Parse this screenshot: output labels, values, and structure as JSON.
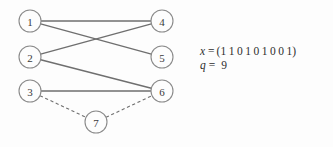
{
  "figure": {
    "name": "bipartite-matching-graph",
    "background_color": "#fdfdfd",
    "edge_color": "#6f6f6f",
    "node_stroke_color": "#8a8a8a",
    "node_label_color": "#3a3a3a"
  },
  "graph": {
    "nodes": [
      {
        "id": "1",
        "label": "1",
        "cx": 30,
        "cy": 21,
        "r": 11
      },
      {
        "id": "2",
        "label": "2",
        "cx": 30,
        "cy": 57,
        "r": 11
      },
      {
        "id": "3",
        "label": "3",
        "cx": 30,
        "cy": 91,
        "r": 11
      },
      {
        "id": "4",
        "label": "4",
        "cx": 162,
        "cy": 21,
        "r": 11
      },
      {
        "id": "5",
        "label": "5",
        "cx": 162,
        "cy": 57,
        "r": 11
      },
      {
        "id": "6",
        "label": "6",
        "cx": 162,
        "cy": 91,
        "r": 11
      },
      {
        "id": "7",
        "label": "7",
        "cx": 96,
        "cy": 122,
        "r": 11
      }
    ],
    "edges": [
      {
        "from": "1",
        "to": "4",
        "style": "solid"
      },
      {
        "from": "1",
        "to": "5",
        "style": "solid"
      },
      {
        "from": "2",
        "to": "4",
        "style": "solid"
      },
      {
        "from": "2",
        "to": "6",
        "style": "solid"
      },
      {
        "from": "3",
        "to": "6",
        "style": "solid"
      },
      {
        "from": "3",
        "to": "7",
        "style": "dashed"
      },
      {
        "from": "7",
        "to": "6",
        "style": "dashed"
      }
    ]
  },
  "annotation": {
    "x_line": {
      "variable": "x",
      "operator": "=",
      "open_paren": "(",
      "bits": [
        "1",
        "1",
        "0",
        "1",
        "0",
        "1",
        "0",
        "0",
        "1"
      ],
      "close_paren": ")"
    },
    "q_line": {
      "variable": "q",
      "operator": "=",
      "value": "9"
    }
  }
}
